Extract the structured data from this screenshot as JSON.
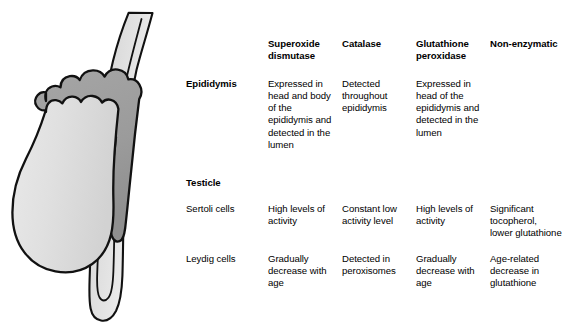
{
  "figure": {
    "caption": "",
    "parts": [
      {
        "name": "vas-deferens",
        "label": "Vas deferens",
        "fill_top": "#d4d4d4",
        "fill_bottom": "#f2f2f2"
      },
      {
        "name": "epididymis",
        "label": "Epididymis",
        "fill": "#9a9a9a"
      },
      {
        "name": "testicle",
        "label": "Testicle",
        "fill_top": "#dcdcdc",
        "fill_bottom": "#efefef"
      }
    ],
    "stroke": "#111111"
  },
  "table": {
    "columns": [
      {
        "key": "label",
        "header": ""
      },
      {
        "key": "sod",
        "header": "Superoxide dismutase"
      },
      {
        "key": "cat",
        "header": "Catalase"
      },
      {
        "key": "gpx",
        "header": "Glutathione peroxidase"
      },
      {
        "key": "non",
        "header": "Non-enzymatic"
      }
    ],
    "headers": {
      "sod": "Superoxide dismutase",
      "cat": "Catalase",
      "gpx": "Glutathione peroxidase",
      "non": "Non-enzymatic"
    },
    "rows": [
      {
        "type": "data",
        "label": "Epididymis",
        "label_bold": true,
        "sod": "Expressed in head and body of the epididymis and detected in the lumen",
        "cat": "Detected throughout epididymis",
        "gpx": "Expressed in head of the epididymis and detected in the lumen",
        "non": ""
      },
      {
        "type": "group",
        "label": "Testicle",
        "label_bold": true,
        "sod": "",
        "cat": "",
        "gpx": "",
        "non": ""
      },
      {
        "type": "data",
        "label": "Sertoli cells",
        "label_bold": false,
        "sod": "High levels of activity",
        "cat": "Constant low activity level",
        "gpx": "High levels of activity",
        "non": "Significant tocopherol, lower glutathione"
      },
      {
        "type": "data",
        "label": "Leydig cells",
        "label_bold": false,
        "sod": "Gradually decrease with age",
        "cat": "Detected in peroxisomes",
        "gpx": "Gradually decrease with age",
        "non": "Age-related decrease in glutathione"
      }
    ]
  },
  "colors": {
    "text": "#000000",
    "background": "#ffffff",
    "epididymis_gray": "#9a9a9a",
    "testicle_gray": "#e2e2e2",
    "duct_gray": "#dddddd",
    "outline": "#111111"
  }
}
